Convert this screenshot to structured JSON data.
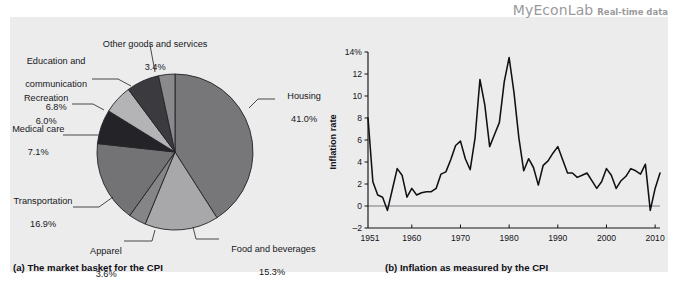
{
  "watermark": {
    "brand": "MyEconLab",
    "subtitle": "Real-time data"
  },
  "panel": {
    "background": "#ececed"
  },
  "chart_data": [
    {
      "type": "pie",
      "title": "(a) The market basket for the CPI",
      "caption": "(a) The market basket for the CPI",
      "unit": "percent",
      "legend": "labels-with-leader-lines",
      "categories": [
        "Housing",
        "Food and beverages",
        "Apparel",
        "Transportation",
        "Medical care",
        "Recreation",
        "Education and communication",
        "Other goods and services"
      ],
      "values": [
        41.0,
        15.3,
        3.6,
        16.9,
        7.1,
        6.0,
        6.8,
        3.4
      ],
      "value_labels": [
        "41.0%",
        "15.3%",
        "3.6%",
        "16.9%",
        "7.1%",
        "6.0%",
        "6.8%",
        "3.4%"
      ],
      "slice_colors": [
        "#77777a",
        "#a8a8ab",
        "#858588",
        "#737376",
        "#242428",
        "#b4b4b7",
        "#3b3b3f",
        "#8a8a8d"
      ],
      "slices": [
        {
          "label": "Housing",
          "value": 41.0,
          "value_label": "41.0%",
          "color": "#77777a"
        },
        {
          "label": "Food and beverages",
          "value": 15.3,
          "value_label": "15.3%",
          "color": "#a8a8ab"
        },
        {
          "label": "Apparel",
          "value": 3.6,
          "value_label": "3.6%",
          "color": "#858588"
        },
        {
          "label": "Transportation",
          "value": 16.9,
          "value_label": "16.9%",
          "color": "#737376"
        },
        {
          "label": "Medical care",
          "value": 7.1,
          "value_label": "7.1%",
          "color": "#242428"
        },
        {
          "label": "Recreation",
          "value": 6.0,
          "value_label": "6.0%",
          "color": "#b4b4b7"
        },
        {
          "label": "Education and communication",
          "value": 6.8,
          "value_label": "6.8%",
          "color": "#3b3b3f"
        },
        {
          "label": "Other goods and services",
          "value": 3.4,
          "value_label": "3.4%",
          "color": "#8a8a8d"
        }
      ],
      "labels_text": {
        "other_goods": "Other goods and services",
        "other_goods_pct": "3.4%",
        "education_l1": "Education and",
        "education_l2": "communication",
        "education_pct": "6.8%",
        "recreation": "Recreation",
        "recreation_pct": "6.0%",
        "medical": "Medical care",
        "medical_pct": "7.1%",
        "transportation": "Transportation",
        "transportation_pct": "16.9%",
        "apparel": "Apparel",
        "apparel_pct": "3.6%",
        "food": "Food and beverages",
        "food_pct": "15.3%",
        "housing": "Housing",
        "housing_pct": "41.0%"
      }
    },
    {
      "type": "line",
      "title": "(b) Inflation as measured by the CPI",
      "caption": "(b) Inflation as measured by the CPI",
      "ylabel": "Inflation rate",
      "xlabel": "",
      "ylim": [
        -2,
        14
      ],
      "xlim": [
        1951,
        2011
      ],
      "grid": false,
      "legend": "none",
      "ytick_labels": [
        "14%",
        "12",
        "10",
        "8",
        "6",
        "4",
        "2",
        "0",
        "-2"
      ],
      "ytick_values": [
        14,
        12,
        10,
        8,
        6,
        4,
        2,
        0,
        -2
      ],
      "xtick_labels": [
        "1951",
        "1960",
        "1970",
        "1980",
        "1990",
        "2000",
        "2010"
      ],
      "xtick_values": [
        1951,
        1960,
        1970,
        1980,
        1990,
        2000,
        2010
      ],
      "series": [
        {
          "name": "CPI inflation rate",
          "x": [
            1951,
            1952,
            1953,
            1954,
            1955,
            1956,
            1957,
            1958,
            1959,
            1960,
            1961,
            1962,
            1963,
            1964,
            1965,
            1966,
            1967,
            1968,
            1969,
            1970,
            1971,
            1972,
            1973,
            1974,
            1975,
            1976,
            1977,
            1978,
            1979,
            1980,
            1981,
            1982,
            1983,
            1984,
            1985,
            1986,
            1987,
            1988,
            1989,
            1990,
            1991,
            1992,
            1993,
            1994,
            1995,
            1996,
            1997,
            1998,
            1999,
            2000,
            2001,
            2002,
            2003,
            2004,
            2005,
            2006,
            2007,
            2008,
            2009,
            2010,
            2011
          ],
          "values": [
            8.0,
            2.2,
            1.0,
            0.8,
            -0.4,
            1.5,
            3.4,
            2.8,
            0.8,
            1.6,
            1.0,
            1.2,
            1.3,
            1.3,
            1.6,
            2.9,
            3.1,
            4.2,
            5.5,
            5.9,
            4.3,
            3.3,
            6.2,
            11.5,
            9.2,
            5.4,
            6.5,
            7.6,
            11.3,
            13.5,
            10.3,
            6.2,
            3.2,
            4.3,
            3.5,
            1.9,
            3.7,
            4.1,
            4.8,
            5.4,
            4.2,
            3.0,
            3.0,
            2.6,
            2.8,
            3.0,
            2.3,
            1.6,
            2.2,
            3.4,
            2.8,
            1.6,
            2.3,
            2.7,
            3.4,
            3.2,
            2.9,
            3.8,
            -0.4,
            1.6,
            3.0
          ]
        }
      ]
    }
  ]
}
